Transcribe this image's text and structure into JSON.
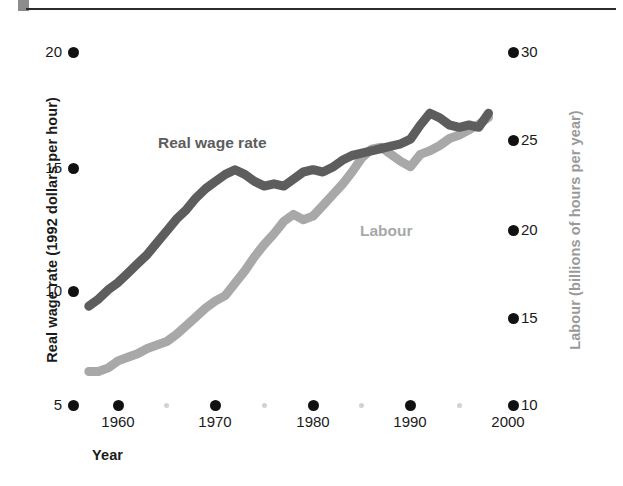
{
  "figure": {
    "background_color": "#ffffff",
    "rule_color": "#2b2b2b",
    "corner_block_color": "#8c8c8c"
  },
  "axes": {
    "x": {
      "title": "Year",
      "ticks": [
        "1960",
        "1970",
        "1980",
        "1990",
        "2000"
      ],
      "tick_positions_px": [
        118,
        215,
        313,
        410,
        508
      ],
      "minor_tick_positions_px": [
        166,
        264,
        361,
        459
      ],
      "range": [
        1957,
        2000
      ]
    },
    "y_left": {
      "title": "Real wage rate (1992 dollars per hour)",
      "ticks": [
        "20",
        "15",
        "10",
        "5"
      ],
      "tick_values": [
        20,
        15,
        10,
        5
      ],
      "tick_positions_px": [
        52,
        168,
        291,
        405
      ],
      "color": "#1a1a1a"
    },
    "y_right": {
      "title": "Labour (billions of hours per year)",
      "ticks": [
        "30",
        "25",
        "20",
        "15",
        "10"
      ],
      "tick_values": [
        30,
        25,
        20,
        15,
        10
      ],
      "tick_positions_px": [
        52,
        140,
        230,
        318,
        405
      ],
      "color": "#9a9a9a"
    }
  },
  "series_labels": {
    "wage": "Real wage rate",
    "labour": "Labour"
  },
  "chart_data": {
    "type": "line",
    "title": "",
    "xlabel": "Year",
    "grid": false,
    "legend": "inline-annotations",
    "x": [
      1957,
      1958,
      1959,
      1960,
      1961,
      1962,
      1963,
      1964,
      1965,
      1966,
      1967,
      1968,
      1969,
      1970,
      1971,
      1972,
      1973,
      1974,
      1975,
      1976,
      1977,
      1978,
      1979,
      1980,
      1981,
      1982,
      1983,
      1984,
      1985,
      1986,
      1987,
      1988,
      1989,
      1990,
      1991,
      1992,
      1993,
      1994,
      1995,
      1996,
      1997,
      1998
    ],
    "series": [
      {
        "name": "Real wage rate",
        "axis": "left",
        "ylabel": "Real wage rate (1992 dollars per hour)",
        "ylim": [
          5,
          20
        ],
        "color": "#5d5d5d",
        "values": [
          9.2,
          9.5,
          9.9,
          10.2,
          10.6,
          11.0,
          11.4,
          11.9,
          12.4,
          12.9,
          13.3,
          13.8,
          14.2,
          14.5,
          14.8,
          15.0,
          14.8,
          14.5,
          14.3,
          14.4,
          14.3,
          14.6,
          14.9,
          15.0,
          14.9,
          15.1,
          15.4,
          15.6,
          15.7,
          15.8,
          15.9,
          16.0,
          16.1,
          16.3,
          16.9,
          17.4,
          17.2,
          16.9,
          16.8,
          16.9,
          16.8,
          17.4
        ]
      },
      {
        "name": "Labour",
        "axis": "right",
        "ylabel": "Labour (billions of hours per year)",
        "ylim": [
          10,
          30
        ],
        "color": "#a8a8a8",
        "values": [
          11.9,
          11.9,
          12.1,
          12.5,
          12.7,
          12.9,
          13.2,
          13.4,
          13.6,
          14.0,
          14.5,
          15.0,
          15.5,
          15.9,
          16.2,
          16.9,
          17.6,
          18.4,
          19.1,
          19.7,
          20.4,
          20.8,
          20.5,
          20.7,
          21.3,
          21.9,
          22.5,
          23.2,
          24.0,
          24.5,
          24.6,
          24.2,
          23.8,
          23.5,
          24.2,
          24.4,
          24.7,
          25.1,
          25.3,
          25.6,
          25.9,
          26.3
        ]
      }
    ]
  }
}
